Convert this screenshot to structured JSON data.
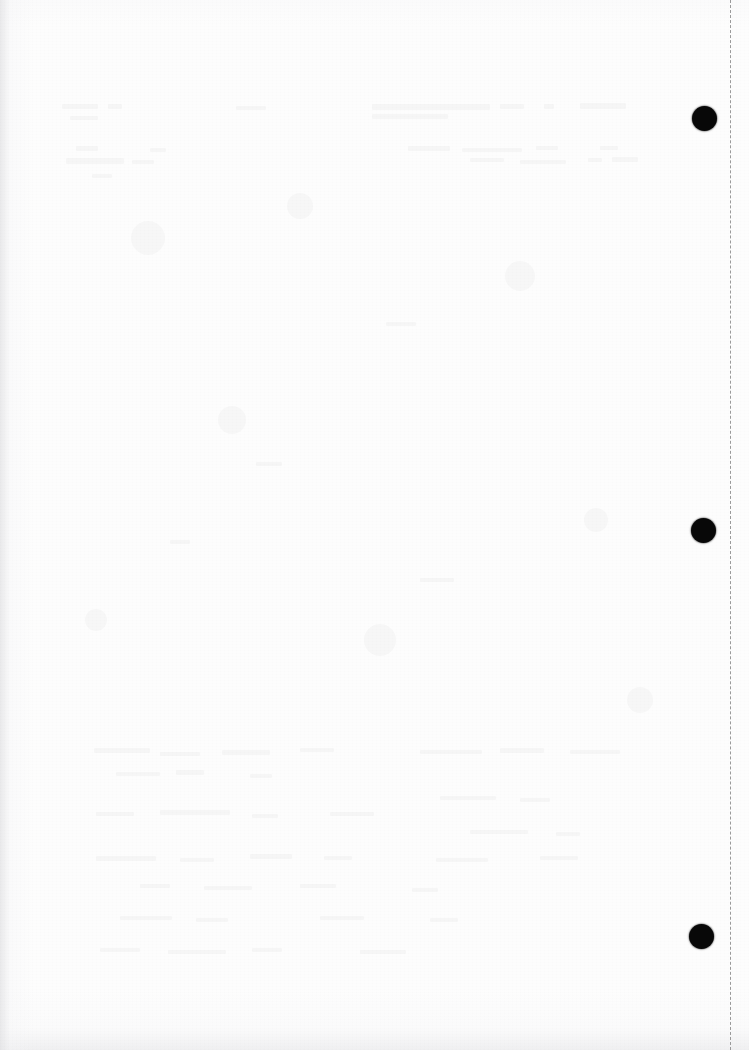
{
  "page": {
    "width": 749,
    "height": 1050,
    "background_color": "#fdfdfd"
  },
  "perforation": {
    "name": "vertical dashed guide line",
    "orientation": "vertical",
    "x": 730,
    "top": 0,
    "bottom": 1050,
    "color": "#9a9a9a",
    "dash_length": 7,
    "gap_length": 5,
    "thickness": 1.6
  },
  "marks": {
    "label": "registration dots",
    "color": "#080808",
    "dots": [
      {
        "name": "dot-top",
        "cx": 704,
        "cy": 118,
        "d": 25
      },
      {
        "name": "dot-middle",
        "cx": 703,
        "cy": 530,
        "d": 25
      },
      {
        "name": "dot-bottom",
        "cx": 701,
        "cy": 936,
        "d": 25
      }
    ]
  },
  "showthrough": {
    "label": "faint reverse-side text bleed-through",
    "color": "rgba(108,110,118,0.05)",
    "lines": [
      {
        "x": 62,
        "y": 104,
        "w": 36,
        "h": 5
      },
      {
        "x": 70,
        "y": 116,
        "w": 28,
        "h": 4
      },
      {
        "x": 108,
        "y": 104,
        "w": 14,
        "h": 5
      },
      {
        "x": 372,
        "y": 104,
        "w": 118,
        "h": 6
      },
      {
        "x": 372,
        "y": 114,
        "w": 76,
        "h": 5
      },
      {
        "x": 500,
        "y": 104,
        "w": 24,
        "h": 5
      },
      {
        "x": 544,
        "y": 104,
        "w": 10,
        "h": 5
      },
      {
        "x": 580,
        "y": 103,
        "w": 46,
        "h": 6
      },
      {
        "x": 236,
        "y": 106,
        "w": 30,
        "h": 4
      },
      {
        "x": 408,
        "y": 146,
        "w": 42,
        "h": 5
      },
      {
        "x": 462,
        "y": 148,
        "w": 60,
        "h": 4
      },
      {
        "x": 536,
        "y": 146,
        "w": 22,
        "h": 4
      },
      {
        "x": 600,
        "y": 146,
        "w": 18,
        "h": 4
      },
      {
        "x": 76,
        "y": 146,
        "w": 22,
        "h": 5
      },
      {
        "x": 150,
        "y": 148,
        "w": 16,
        "h": 4
      },
      {
        "x": 66,
        "y": 158,
        "w": 58,
        "h": 6
      },
      {
        "x": 132,
        "y": 160,
        "w": 22,
        "h": 4
      },
      {
        "x": 470,
        "y": 158,
        "w": 34,
        "h": 4
      },
      {
        "x": 520,
        "y": 160,
        "w": 46,
        "h": 4
      },
      {
        "x": 588,
        "y": 158,
        "w": 14,
        "h": 4
      },
      {
        "x": 612,
        "y": 157,
        "w": 26,
        "h": 5
      },
      {
        "x": 92,
        "y": 174,
        "w": 20,
        "h": 4
      },
      {
        "x": 386,
        "y": 322,
        "w": 30,
        "h": 4
      },
      {
        "x": 256,
        "y": 462,
        "w": 26,
        "h": 4
      },
      {
        "x": 170,
        "y": 540,
        "w": 20,
        "h": 4
      },
      {
        "x": 420,
        "y": 578,
        "w": 34,
        "h": 4
      },
      {
        "x": 94,
        "y": 748,
        "w": 56,
        "h": 5
      },
      {
        "x": 160,
        "y": 752,
        "w": 40,
        "h": 4
      },
      {
        "x": 222,
        "y": 750,
        "w": 48,
        "h": 5
      },
      {
        "x": 300,
        "y": 748,
        "w": 34,
        "h": 4
      },
      {
        "x": 420,
        "y": 750,
        "w": 62,
        "h": 4
      },
      {
        "x": 500,
        "y": 748,
        "w": 44,
        "h": 5
      },
      {
        "x": 570,
        "y": 750,
        "w": 50,
        "h": 4
      },
      {
        "x": 116,
        "y": 772,
        "w": 44,
        "h": 4
      },
      {
        "x": 176,
        "y": 770,
        "w": 28,
        "h": 5
      },
      {
        "x": 250,
        "y": 774,
        "w": 22,
        "h": 4
      },
      {
        "x": 440,
        "y": 796,
        "w": 56,
        "h": 4
      },
      {
        "x": 520,
        "y": 798,
        "w": 30,
        "h": 4
      },
      {
        "x": 96,
        "y": 812,
        "w": 38,
        "h": 4
      },
      {
        "x": 160,
        "y": 810,
        "w": 70,
        "h": 5
      },
      {
        "x": 252,
        "y": 814,
        "w": 26,
        "h": 4
      },
      {
        "x": 330,
        "y": 812,
        "w": 44,
        "h": 4
      },
      {
        "x": 470,
        "y": 830,
        "w": 58,
        "h": 4
      },
      {
        "x": 556,
        "y": 832,
        "w": 24,
        "h": 4
      },
      {
        "x": 96,
        "y": 856,
        "w": 60,
        "h": 5
      },
      {
        "x": 180,
        "y": 858,
        "w": 34,
        "h": 4
      },
      {
        "x": 250,
        "y": 854,
        "w": 42,
        "h": 5
      },
      {
        "x": 324,
        "y": 856,
        "w": 28,
        "h": 4
      },
      {
        "x": 436,
        "y": 858,
        "w": 52,
        "h": 4
      },
      {
        "x": 540,
        "y": 856,
        "w": 38,
        "h": 4
      },
      {
        "x": 140,
        "y": 884,
        "w": 30,
        "h": 4
      },
      {
        "x": 204,
        "y": 886,
        "w": 48,
        "h": 4
      },
      {
        "x": 300,
        "y": 884,
        "w": 36,
        "h": 4
      },
      {
        "x": 412,
        "y": 888,
        "w": 26,
        "h": 4
      },
      {
        "x": 120,
        "y": 916,
        "w": 52,
        "h": 4
      },
      {
        "x": 196,
        "y": 918,
        "w": 32,
        "h": 4
      },
      {
        "x": 320,
        "y": 916,
        "w": 44,
        "h": 4
      },
      {
        "x": 430,
        "y": 918,
        "w": 28,
        "h": 4
      },
      {
        "x": 100,
        "y": 948,
        "w": 40,
        "h": 4
      },
      {
        "x": 168,
        "y": 950,
        "w": 58,
        "h": 4
      },
      {
        "x": 252,
        "y": 948,
        "w": 30,
        "h": 4
      },
      {
        "x": 360,
        "y": 950,
        "w": 46,
        "h": 4
      }
    ],
    "blobs": [
      {
        "cx": 148,
        "cy": 238,
        "d": 34
      },
      {
        "cx": 300,
        "cy": 206,
        "d": 26
      },
      {
        "cx": 520,
        "cy": 276,
        "d": 30
      },
      {
        "cx": 232,
        "cy": 420,
        "d": 28
      },
      {
        "cx": 596,
        "cy": 520,
        "d": 24
      },
      {
        "cx": 380,
        "cy": 640,
        "d": 32
      },
      {
        "cx": 96,
        "cy": 620,
        "d": 22
      },
      {
        "cx": 640,
        "cy": 700,
        "d": 26
      }
    ]
  }
}
